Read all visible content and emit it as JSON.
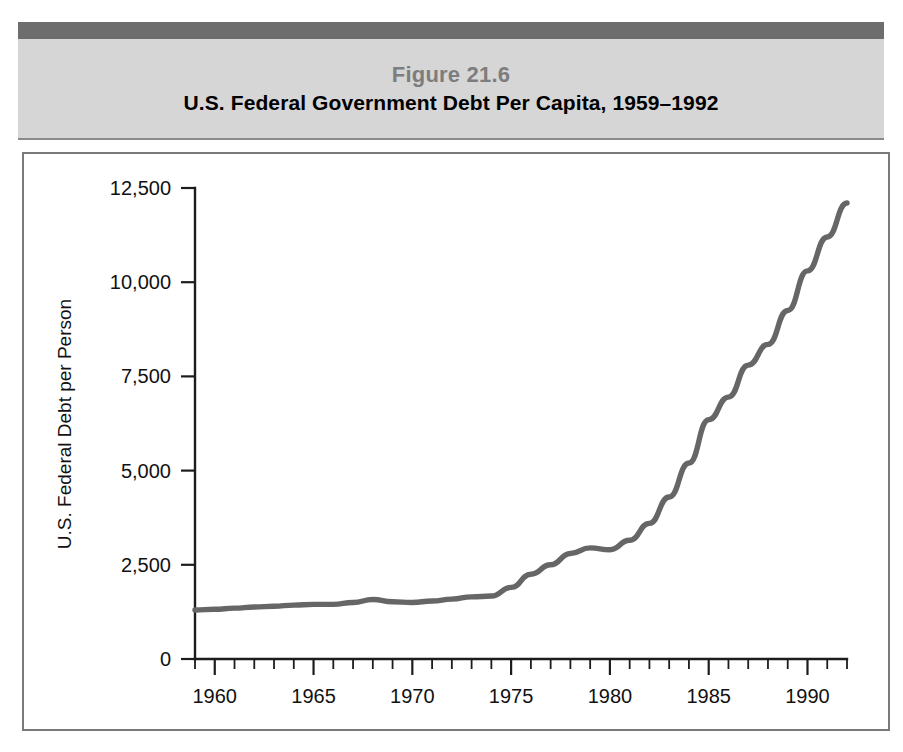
{
  "figure": {
    "number_label": "Figure 21.6",
    "title": "U.S. Federal Government Debt Per Capita, 1959–1992"
  },
  "colors": {
    "header_top_bar": "#6d6d6d",
    "header_band": "#d6d6d6",
    "figure_number_text": "#7d7d7d",
    "title_text": "#000000",
    "frame_border": "#7a7a7a",
    "axis": "#1c1c1c",
    "data_line": "#666666",
    "background": "#ffffff"
  },
  "chart_data": {
    "type": "line",
    "title": "U.S. Federal Government Debt Per Capita, 1959–1992",
    "subtitle": "Figure 21.6",
    "xlabel": "",
    "ylabel": "U.S. Federal Debt per Person",
    "xlim": [
      1959,
      1992
    ],
    "ylim": [
      0,
      12500
    ],
    "grid": false,
    "legend": null,
    "y_ticks": [
      0,
      2500,
      5000,
      7500,
      10000,
      12500
    ],
    "y_tick_labels": [
      "0",
      "2,500",
      "5,000",
      "7,500",
      "10,000",
      "12,500"
    ],
    "x_ticks": [
      1959,
      1960,
      1961,
      1962,
      1963,
      1964,
      1965,
      1966,
      1967,
      1968,
      1969,
      1970,
      1971,
      1972,
      1973,
      1974,
      1975,
      1976,
      1977,
      1978,
      1979,
      1980,
      1981,
      1982,
      1983,
      1984,
      1985,
      1986,
      1987,
      1988,
      1989,
      1990,
      1991,
      1992
    ],
    "x_tick_labels_shown": [
      "1960",
      "1965",
      "1970",
      "1975",
      "1980",
      "1985",
      "1990"
    ],
    "x_tick_labels_shown_values": [
      1960,
      1965,
      1970,
      1975,
      1980,
      1985,
      1990
    ],
    "series": [
      {
        "name": "U.S. Federal Debt per Person",
        "x": [
          1959,
          1960,
          1961,
          1962,
          1963,
          1964,
          1965,
          1966,
          1967,
          1968,
          1969,
          1970,
          1971,
          1972,
          1973,
          1974,
          1975,
          1976,
          1977,
          1978,
          1979,
          1980,
          1981,
          1982,
          1983,
          1984,
          1985,
          1986,
          1987,
          1988,
          1989,
          1990,
          1991,
          1992
        ],
        "values": [
          1300,
          1320,
          1350,
          1380,
          1400,
          1430,
          1450,
          1450,
          1500,
          1580,
          1520,
          1500,
          1540,
          1590,
          1650,
          1670,
          1900,
          2250,
          2500,
          2800,
          2950,
          2900,
          3150,
          3600,
          4300,
          5200,
          6350,
          6950,
          7800,
          8350,
          9250,
          10300,
          11200,
          12100
        ]
      }
    ],
    "annotations": []
  },
  "geometry": {
    "plot_left_px": 171,
    "plot_right_px": 823,
    "plot_top_px": 34,
    "plot_bottom_px": 505,
    "svg_width": 864,
    "svg_height": 575
  }
}
